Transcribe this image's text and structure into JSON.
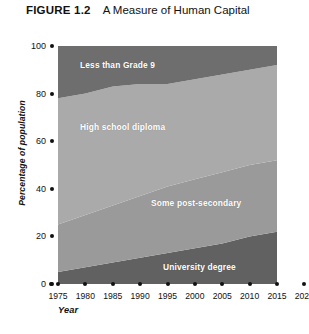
{
  "figure": {
    "number_label": "FIGURE 1.2",
    "title": "A Measure of Human Capital"
  },
  "axis": {
    "y_title": "Percentage of population",
    "x_title": "Year"
  },
  "footnote": {
    "text": ""
  },
  "chart_data": {
    "type": "area",
    "title": "A Measure of Human Capital",
    "xlabel": "Year",
    "ylabel": "Percentage of population",
    "xlim": [
      1975,
      2020
    ],
    "ylim": [
      0,
      100
    ],
    "grid": false,
    "legend_position": "inline-band-labels",
    "stacked": true,
    "x": [
      1975,
      1980,
      1985,
      1990,
      1995,
      2000,
      2005,
      2010,
      2015
    ],
    "x_tick_labels": [
      "1975",
      "1980",
      "1985",
      "1990",
      "1995",
      "2000",
      "2005",
      "2010",
      "2015",
      "2020"
    ],
    "y_tick_labels": [
      "0",
      "20",
      "40",
      "60",
      "80",
      "100"
    ],
    "y_ticks": [
      0,
      20,
      40,
      60,
      80,
      100
    ],
    "series": [
      {
        "name": "University degree",
        "color": "#616161",
        "label_color": "#ffffff",
        "values": [
          5,
          7,
          9,
          11,
          13,
          15,
          17,
          20,
          22
        ]
      },
      {
        "name": "Some post-secondary",
        "color": "#9a9a9a",
        "label_color": "#ffffff",
        "values": [
          20,
          22,
          24,
          26,
          28,
          29,
          30,
          30,
          30
        ]
      },
      {
        "name": "High school diploma",
        "color": "#aaaaaa",
        "label_color": "#ffffff",
        "values": [
          53,
          51,
          50,
          47,
          43,
          42,
          41,
          40,
          40
        ]
      },
      {
        "name": "Less than Grade 9",
        "color": "#6e6e6e",
        "label_color": "#ffffff",
        "values": [
          22,
          20,
          17,
          16,
          16,
          14,
          12,
          10,
          8
        ]
      }
    ],
    "band_labels": [
      {
        "text": "Less than Grade 9",
        "x_px": 22,
        "y_px": 14
      },
      {
        "text": "High school diploma",
        "x_px": 22,
        "y_px": 76
      },
      {
        "text": "Some post-secondary",
        "x_px": 93,
        "y_px": 152
      },
      {
        "text": "University degree",
        "x_px": 105,
        "y_px": 216
      }
    ]
  }
}
